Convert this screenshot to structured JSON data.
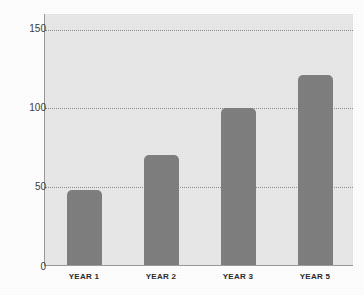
{
  "chart_data": {
    "type": "bar",
    "title": "",
    "subtitle": "",
    "xlabel": "",
    "ylabel": "",
    "categories": [
      "YEAR 1",
      "YEAR 2",
      "YEAR 3",
      "YEAR 5"
    ],
    "values": [
      48,
      70,
      100,
      121
    ],
    "series": [
      {
        "name": "",
        "values": [
          48,
          70,
          100,
          121
        ]
      }
    ],
    "ylim": [
      0,
      160
    ],
    "yticks": [
      0,
      50,
      100,
      150
    ],
    "ytick_labels": [
      "0",
      "50",
      "100",
      "150"
    ],
    "gridlines": [
      "50",
      "100",
      "150"
    ],
    "grid": true,
    "grid_style": "dotted",
    "legend": false,
    "legend_position": "none",
    "annotations": []
  },
  "style": {
    "bar_color": "#7e7e7e",
    "plot_background": "#e9e9e9",
    "figure_background": "#ffffff",
    "gridline_color": "#8d8d8d",
    "axis_color": "#9a9a9a",
    "tick_label_color": "#3a3a3a",
    "category_label_color": "#2a2a2a"
  }
}
